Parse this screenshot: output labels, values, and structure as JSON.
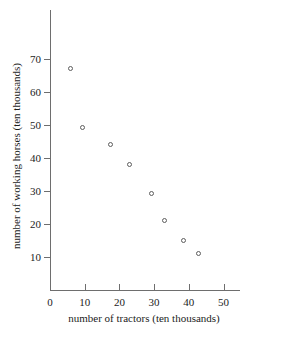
{
  "chart_data": {
    "type": "scatter",
    "title": "",
    "xlabel": "number of tractors (ten thousands)",
    "ylabel": "number of working horses (ten thousands)",
    "xlim": [
      0,
      55
    ],
    "ylim": [
      0,
      75
    ],
    "xticks": [
      0,
      10,
      20,
      30,
      40,
      50
    ],
    "yticks": [
      10,
      20,
      30,
      40,
      50,
      60,
      70
    ],
    "grid": false,
    "legend": null,
    "marker": "open-circle",
    "marker_color": "#5d5d5d",
    "points": [
      {
        "x": 6,
        "y": 67
      },
      {
        "x": 9.5,
        "y": 49
      },
      {
        "x": 17.5,
        "y": 44
      },
      {
        "x": 23,
        "y": 38
      },
      {
        "x": 29.5,
        "y": 29
      },
      {
        "x": 33,
        "y": 21
      },
      {
        "x": 38.5,
        "y": 15
      },
      {
        "x": 43,
        "y": 11
      }
    ]
  },
  "axes": {
    "x_tick_labels": [
      "0",
      "10",
      "20",
      "30",
      "40",
      "50"
    ],
    "y_tick_labels": [
      "10",
      "20",
      "30",
      "40",
      "50",
      "60",
      "70"
    ],
    "x_title": "number of tractors (ten thousands)",
    "y_title": "number of working horses (ten thousands)"
  }
}
